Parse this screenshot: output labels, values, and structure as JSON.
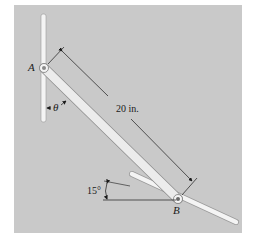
{
  "figure": {
    "background_color": "#c9c9c9",
    "bar_color": "#f2f2f2",
    "line_color": "#1a1a1a",
    "labels": {
      "point_a": "A",
      "point_b": "B",
      "angle_theta": "θ",
      "length": "20 in.",
      "angle_slot": "15°"
    }
  }
}
